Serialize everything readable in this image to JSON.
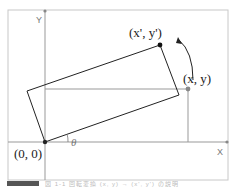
{
  "diagram": {
    "axes": {
      "x_label": "X",
      "y_label": "Y"
    },
    "points": {
      "origin": {
        "label": "(0, 0)"
      },
      "original": {
        "label": "(x, y)"
      },
      "rotated": {
        "label": "(x', y')"
      }
    },
    "angle_label": "θ",
    "colors": {
      "frame": "#c8c8c8",
      "axis": "#999999",
      "rect": "#222222",
      "guide": "#999999",
      "dot_dark": "#111111",
      "dot_gray": "#888888"
    }
  },
  "caption": {
    "text": "図 1-1 回転変換 (x, y) → (x', y') の説明"
  }
}
